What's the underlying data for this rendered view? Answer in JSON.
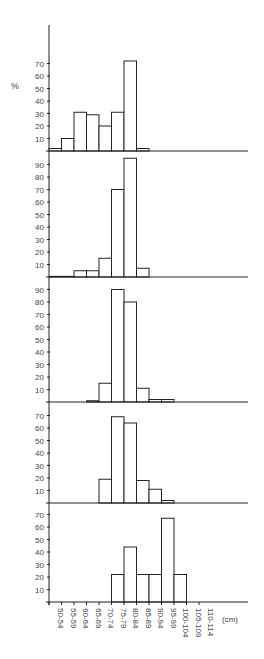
{
  "chart_data": {
    "type": "bar",
    "layout": "5 vertically stacked histogram panels sharing x-axis",
    "ylabel": "%",
    "xlabel": "(cm)",
    "categories": [
      "50-54",
      "55-59",
      "60-64",
      "65-69",
      "70-74",
      "75-79",
      "80-84",
      "85-89",
      "90-94",
      "95-99",
      "100-104",
      "105-109",
      "110-114"
    ],
    "grid": false,
    "legend": null,
    "panels": [
      {
        "name": "panel-1",
        "ylim": [
          0,
          70
        ],
        "yticks": [
          10,
          20,
          30,
          40,
          50,
          60,
          70
        ],
        "values": [
          2,
          10,
          31,
          29,
          20,
          31,
          72,
          2,
          0,
          0,
          0,
          0,
          0
        ]
      },
      {
        "name": "panel-2",
        "ylim": [
          0,
          90
        ],
        "yticks": [
          10,
          20,
          30,
          40,
          50,
          60,
          70,
          80,
          90
        ],
        "values": [
          0.5,
          0.5,
          5,
          5,
          15,
          70,
          95,
          7,
          0,
          0,
          0,
          0,
          0
        ]
      },
      {
        "name": "panel-3",
        "ylim": [
          0,
          90
        ],
        "yticks": [
          10,
          20,
          30,
          40,
          50,
          60,
          70,
          80,
          90
        ],
        "values": [
          0,
          0,
          0,
          1,
          15,
          90,
          80,
          11,
          2,
          2,
          0,
          0,
          0
        ]
      },
      {
        "name": "panel-4",
        "ylim": [
          0,
          70
        ],
        "yticks": [
          10,
          20,
          30,
          40,
          50,
          60,
          70
        ],
        "values": [
          0,
          0,
          0,
          0,
          19,
          69,
          64,
          18,
          11,
          2,
          0,
          0,
          0
        ]
      },
      {
        "name": "panel-5",
        "ylim": [
          0,
          70
        ],
        "yticks": [
          10,
          20,
          30,
          40,
          50,
          60,
          70
        ],
        "values": [
          0,
          0,
          0,
          0,
          0,
          22,
          44,
          22,
          22,
          67,
          22,
          0,
          0
        ]
      }
    ]
  },
  "geometry": {
    "axis_x": 49,
    "axis_top": 25,
    "axis_right": 248,
    "bar_width": 12.5,
    "px_per_unit": 1.25,
    "baselines": [
      151,
      277,
      402,
      503,
      602
    ]
  },
  "colors": {
    "axis": "#222222",
    "bar_fill": "#ffffff",
    "bar_stroke": "#222222",
    "text": "#444444"
  }
}
